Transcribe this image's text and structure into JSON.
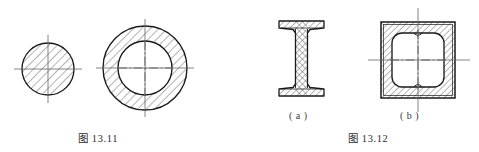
{
  "page": {
    "background": "#ffffff",
    "line_color": "#1a1a1a",
    "hatch_color": "#4a4a4a",
    "centerline_color": "#555555",
    "width": 479,
    "height": 152
  },
  "figures": [
    {
      "id": "fig-13-11",
      "caption": "图 13.11",
      "caption_x": 78,
      "caption_y": 130,
      "shapes": [
        {
          "name": "solid-circular-section",
          "type": "circle",
          "cx": 48,
          "cy": 69,
          "r": 26,
          "hatched": true,
          "hatch_angle_deg": 45,
          "centerline_h": {
            "x1": 14,
            "y1": 69,
            "x2": 82,
            "y2": 69
          },
          "centerline_v": {
            "x1": 48,
            "y1": 35,
            "x2": 48,
            "y2": 103
          }
        },
        {
          "name": "annular-circular-section",
          "type": "annulus",
          "cx": 145,
          "cy": 68,
          "r_outer": 42,
          "r_inner": 27,
          "hatched": true,
          "hatch_angle_deg": 45,
          "centerline_h": {
            "x1": 96,
            "y1": 68,
            "x2": 194,
            "y2": 68
          },
          "centerline_v": {
            "x1": 145,
            "y1": 19,
            "x2": 145,
            "y2": 117
          }
        }
      ]
    },
    {
      "id": "fig-13-12",
      "caption": "图 13.12",
      "caption_x": 348,
      "caption_y": 130,
      "sublabels": [
        {
          "name": "sublabel-a",
          "text": "( a )",
          "x": 289,
          "y": 110
        },
        {
          "name": "sublabel-b",
          "text": "( b )",
          "x": 400,
          "y": 110
        }
      ],
      "shapes": [
        {
          "name": "i-beam-section",
          "type": "i-beam",
          "x_left": 279,
          "x_right": 324,
          "y_top": 21,
          "y_bottom": 96,
          "flange_thickness": 7,
          "web_thickness": 8,
          "hatched": true,
          "hatch_angle_deg": 45
        },
        {
          "name": "box-section",
          "type": "box",
          "x_left": 381,
          "x_right": 455,
          "y_top": 22,
          "y_bottom": 98,
          "wall_thickness": 11,
          "inner_corner_radius": 10,
          "hatched": true,
          "hatch_angle_deg": 45,
          "centerline_h": {
            "x1": 368,
            "y1": 60,
            "x2": 470,
            "y2": 60
          },
          "centerline_v": {
            "x1": 418,
            "y1": 8,
            "x2": 418,
            "y2": 112
          }
        }
      ]
    }
  ]
}
